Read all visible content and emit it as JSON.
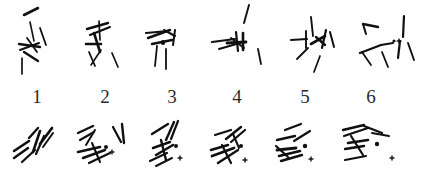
{
  "figure": {
    "type": "scatter",
    "title": "",
    "background_color": "#ffffff",
    "ink_color": "#101010",
    "label_color": "#2b2b2b",
    "width": 431,
    "height": 178,
    "rows": 2,
    "columns": 6
  },
  "labels": {
    "items": [
      {
        "text": "1",
        "x": 22,
        "y": 84
      },
      {
        "text": "2",
        "x": 90,
        "y": 84
      },
      {
        "text": "3",
        "x": 157,
        "y": 84
      },
      {
        "text": "4",
        "x": 222,
        "y": 84
      },
      {
        "text": "5",
        "x": 290,
        "y": 84
      },
      {
        "text": "6",
        "x": 356,
        "y": 84
      }
    ]
  },
  "chart_data": {
    "type": "scatter",
    "title": "",
    "xlabel": "",
    "ylabel": "",
    "legend": [],
    "grid": false,
    "panel_labels": [
      "1",
      "2",
      "3",
      "4",
      "5",
      "6"
    ],
    "marker_types": [
      "stroke-segment",
      "filled-dot",
      "plus-cross"
    ],
    "top_row": [
      {
        "label": "1",
        "strokes": [
          {
            "x1": 24,
            "y1": 15,
            "x2": 38,
            "y2": 8,
            "w": 2.6
          },
          {
            "x1": 30,
            "y1": 22,
            "x2": 34,
            "y2": 41,
            "w": 1.6
          },
          {
            "x1": 19,
            "y1": 44,
            "x2": 40,
            "y2": 47,
            "w": 2.4
          },
          {
            "x1": 20,
            "y1": 50,
            "x2": 39,
            "y2": 43,
            "w": 2.0
          },
          {
            "x1": 27,
            "y1": 38,
            "x2": 37,
            "y2": 52,
            "w": 1.8
          },
          {
            "x1": 24,
            "y1": 52,
            "x2": 38,
            "y2": 61,
            "w": 2.4
          },
          {
            "x1": 40,
            "y1": 28,
            "x2": 46,
            "y2": 45,
            "w": 1.8
          },
          {
            "x1": 22,
            "y1": 58,
            "x2": 22,
            "y2": 74,
            "w": 1.7
          }
        ],
        "dot": null,
        "plus": null
      },
      {
        "label": "2",
        "strokes": [
          {
            "x1": 87,
            "y1": 29,
            "x2": 108,
            "y2": 23,
            "w": 2.4
          },
          {
            "x1": 90,
            "y1": 35,
            "x2": 110,
            "y2": 27,
            "w": 2.1
          },
          {
            "x1": 99,
            "y1": 21,
            "x2": 100,
            "y2": 40,
            "w": 1.7
          },
          {
            "x1": 86,
            "y1": 44,
            "x2": 101,
            "y2": 44,
            "w": 2.5
          },
          {
            "x1": 94,
            "y1": 33,
            "x2": 100,
            "y2": 52,
            "w": 2.6
          },
          {
            "x1": 89,
            "y1": 52,
            "x2": 95,
            "y2": 66,
            "w": 1.8
          },
          {
            "x1": 101,
            "y1": 50,
            "x2": 91,
            "y2": 65,
            "w": 1.6
          },
          {
            "x1": 112,
            "y1": 53,
            "x2": 118,
            "y2": 67,
            "w": 1.7
          }
        ],
        "dot": null,
        "plus": null
      },
      {
        "label": "3",
        "strokes": [
          {
            "x1": 146,
            "y1": 33,
            "x2": 168,
            "y2": 31,
            "w": 2.2
          },
          {
            "x1": 148,
            "y1": 38,
            "x2": 170,
            "y2": 30,
            "w": 2.4
          },
          {
            "x1": 164,
            "y1": 30,
            "x2": 175,
            "y2": 36,
            "w": 2.0
          },
          {
            "x1": 175,
            "y1": 30,
            "x2": 173,
            "y2": 45,
            "w": 2.0
          },
          {
            "x1": 152,
            "y1": 44,
            "x2": 172,
            "y2": 40,
            "w": 2.4
          },
          {
            "x1": 163,
            "y1": 42,
            "x2": 163,
            "y2": 43,
            "w": 4.2
          },
          {
            "x1": 157,
            "y1": 46,
            "x2": 155,
            "y2": 66,
            "w": 1.8
          },
          {
            "x1": 166,
            "y1": 49,
            "x2": 166,
            "y2": 69,
            "w": 1.8
          }
        ],
        "dot": null,
        "plus": null
      },
      {
        "label": "4",
        "strokes": [
          {
            "x1": 249,
            "y1": 5,
            "x2": 244,
            "y2": 23,
            "w": 1.9
          },
          {
            "x1": 212,
            "y1": 42,
            "x2": 235,
            "y2": 39,
            "w": 2.2
          },
          {
            "x1": 219,
            "y1": 49,
            "x2": 240,
            "y2": 43,
            "w": 2.0
          },
          {
            "x1": 227,
            "y1": 43,
            "x2": 246,
            "y2": 42,
            "w": 2.8
          },
          {
            "x1": 236,
            "y1": 32,
            "x2": 238,
            "y2": 51,
            "w": 2.2
          },
          {
            "x1": 243,
            "y1": 33,
            "x2": 243,
            "y2": 50,
            "w": 2.6
          },
          {
            "x1": 231,
            "y1": 38,
            "x2": 244,
            "y2": 48,
            "w": 2.0
          },
          {
            "x1": 258,
            "y1": 49,
            "x2": 261,
            "y2": 64,
            "w": 1.8
          }
        ],
        "dot": null,
        "plus": null
      },
      {
        "label": "5",
        "strokes": [
          {
            "x1": 291,
            "y1": 40,
            "x2": 307,
            "y2": 39,
            "w": 2.0
          },
          {
            "x1": 306,
            "y1": 31,
            "x2": 306,
            "y2": 48,
            "w": 1.9
          },
          {
            "x1": 311,
            "y1": 17,
            "x2": 313,
            "y2": 36,
            "w": 1.9
          },
          {
            "x1": 311,
            "y1": 44,
            "x2": 325,
            "y2": 36,
            "w": 2.6
          },
          {
            "x1": 316,
            "y1": 37,
            "x2": 325,
            "y2": 45,
            "w": 2.4
          },
          {
            "x1": 326,
            "y1": 30,
            "x2": 322,
            "y2": 48,
            "w": 2.2
          },
          {
            "x1": 330,
            "y1": 32,
            "x2": 334,
            "y2": 47,
            "w": 2.0
          },
          {
            "x1": 297,
            "y1": 59,
            "x2": 308,
            "y2": 48,
            "w": 1.8
          },
          {
            "x1": 314,
            "y1": 72,
            "x2": 320,
            "y2": 56,
            "w": 1.7
          }
        ],
        "dot": null,
        "plus": null
      },
      {
        "label": "6",
        "strokes": [
          {
            "x1": 363,
            "y1": 24,
            "x2": 378,
            "y2": 27,
            "w": 2.4
          },
          {
            "x1": 363,
            "y1": 24,
            "x2": 366,
            "y2": 34,
            "w": 2.0
          },
          {
            "x1": 404,
            "y1": 16,
            "x2": 403,
            "y2": 37,
            "w": 2.2
          },
          {
            "x1": 360,
            "y1": 53,
            "x2": 381,
            "y2": 45,
            "w": 2.4
          },
          {
            "x1": 381,
            "y1": 45,
            "x2": 393,
            "y2": 43,
            "w": 2.2
          },
          {
            "x1": 400,
            "y1": 41,
            "x2": 398,
            "y2": 58,
            "w": 2.2
          },
          {
            "x1": 408,
            "y1": 43,
            "x2": 414,
            "y2": 60,
            "w": 1.9
          },
          {
            "x1": 371,
            "y1": 65,
            "x2": 362,
            "y2": 52,
            "w": 1.8
          },
          {
            "x1": 388,
            "y1": 67,
            "x2": 382,
            "y2": 52,
            "w": 1.8
          }
        ],
        "dot": {
          "x": 394,
          "y": 41,
          "r": 1.6
        },
        "plus": {
          "x": 399,
          "y": 41,
          "size": 5
        }
      }
    ],
    "bottom_row": [
      {
        "strokes": [
          {
            "x1": 14,
            "y1": 151,
            "x2": 29,
            "y2": 141,
            "w": 2.6
          },
          {
            "x1": 14,
            "y1": 158,
            "x2": 28,
            "y2": 148,
            "w": 2.4
          },
          {
            "x1": 22,
            "y1": 162,
            "x2": 35,
            "y2": 150,
            "w": 2.2
          },
          {
            "x1": 29,
            "y1": 138,
            "x2": 38,
            "y2": 128,
            "w": 2.4
          },
          {
            "x1": 33,
            "y1": 152,
            "x2": 40,
            "y2": 131,
            "w": 2.6
          },
          {
            "x1": 36,
            "y1": 154,
            "x2": 44,
            "y2": 136,
            "w": 2.2
          },
          {
            "x1": 40,
            "y1": 144,
            "x2": 52,
            "y2": 128,
            "w": 2.8
          },
          {
            "x1": 43,
            "y1": 147,
            "x2": 53,
            "y2": 133,
            "w": 2.0
          }
        ],
        "dot": null,
        "plus": null
      },
      {
        "strokes": [
          {
            "x1": 78,
            "y1": 133,
            "x2": 93,
            "y2": 126,
            "w": 2.4
          },
          {
            "x1": 80,
            "y1": 140,
            "x2": 94,
            "y2": 132,
            "w": 2.2
          },
          {
            "x1": 86,
            "y1": 145,
            "x2": 95,
            "y2": 130,
            "w": 2.0
          },
          {
            "x1": 113,
            "y1": 127,
            "x2": 121,
            "y2": 142,
            "w": 2.2
          },
          {
            "x1": 122,
            "y1": 124,
            "x2": 124,
            "y2": 143,
            "w": 2.4
          },
          {
            "x1": 78,
            "y1": 152,
            "x2": 100,
            "y2": 147,
            "w": 2.6
          },
          {
            "x1": 83,
            "y1": 158,
            "x2": 105,
            "y2": 150,
            "w": 2.4
          },
          {
            "x1": 89,
            "y1": 163,
            "x2": 110,
            "y2": 153,
            "w": 2.2
          },
          {
            "x1": 92,
            "y1": 143,
            "x2": 100,
            "y2": 162,
            "w": 2.0
          }
        ],
        "dot": {
          "x": 106,
          "y": 147,
          "r": 2.0
        },
        "plus": {
          "x": 112,
          "y": 152,
          "size": 5
        }
      },
      {
        "strokes": [
          {
            "x1": 152,
            "y1": 134,
            "x2": 168,
            "y2": 124,
            "w": 2.4
          },
          {
            "x1": 166,
            "y1": 140,
            "x2": 174,
            "y2": 122,
            "w": 2.4
          },
          {
            "x1": 171,
            "y1": 139,
            "x2": 178,
            "y2": 121,
            "w": 2.2
          },
          {
            "x1": 153,
            "y1": 148,
            "x2": 170,
            "y2": 142,
            "w": 2.4
          },
          {
            "x1": 156,
            "y1": 155,
            "x2": 173,
            "y2": 145,
            "w": 2.6
          },
          {
            "x1": 161,
            "y1": 140,
            "x2": 166,
            "y2": 160,
            "w": 2.4
          },
          {
            "x1": 150,
            "y1": 161,
            "x2": 167,
            "y2": 153,
            "w": 2.2
          },
          {
            "x1": 156,
            "y1": 166,
            "x2": 172,
            "y2": 158,
            "w": 2.0
          }
        ],
        "dot": {
          "x": 176,
          "y": 146,
          "r": 2.0
        },
        "plus": {
          "x": 180,
          "y": 158,
          "size": 5
        }
      },
      {
        "strokes": [
          {
            "x1": 215,
            "y1": 135,
            "x2": 231,
            "y2": 130,
            "w": 2.2
          },
          {
            "x1": 226,
            "y1": 139,
            "x2": 241,
            "y2": 127,
            "w": 2.4
          },
          {
            "x1": 231,
            "y1": 142,
            "x2": 245,
            "y2": 130,
            "w": 2.2
          },
          {
            "x1": 211,
            "y1": 150,
            "x2": 228,
            "y2": 145,
            "w": 2.6
          },
          {
            "x1": 212,
            "y1": 156,
            "x2": 234,
            "y2": 148,
            "w": 2.8
          },
          {
            "x1": 218,
            "y1": 163,
            "x2": 238,
            "y2": 150,
            "w": 2.4
          },
          {
            "x1": 222,
            "y1": 145,
            "x2": 231,
            "y2": 163,
            "w": 2.2
          },
          {
            "x1": 233,
            "y1": 134,
            "x2": 239,
            "y2": 148,
            "w": 2.0
          }
        ],
        "dot": {
          "x": 241,
          "y": 146,
          "r": 2.0
        },
        "plus": {
          "x": 245,
          "y": 160,
          "size": 5
        }
      },
      {
        "strokes": [
          {
            "x1": 285,
            "y1": 130,
            "x2": 301,
            "y2": 124,
            "w": 2.2
          },
          {
            "x1": 277,
            "y1": 140,
            "x2": 295,
            "y2": 136,
            "w": 2.4
          },
          {
            "x1": 294,
            "y1": 141,
            "x2": 310,
            "y2": 131,
            "w": 2.2
          },
          {
            "x1": 277,
            "y1": 150,
            "x2": 296,
            "y2": 148,
            "w": 2.8
          },
          {
            "x1": 279,
            "y1": 156,
            "x2": 300,
            "y2": 151,
            "w": 2.6
          },
          {
            "x1": 281,
            "y1": 161,
            "x2": 302,
            "y2": 155,
            "w": 2.4
          },
          {
            "x1": 276,
            "y1": 146,
            "x2": 288,
            "y2": 157,
            "w": 2.2
          }
        ],
        "dot": {
          "x": 305,
          "y": 146,
          "r": 2.2
        },
        "plus": {
          "x": 311,
          "y": 159,
          "size": 5
        }
      },
      {
        "strokes": [
          {
            "x1": 343,
            "y1": 130,
            "x2": 364,
            "y2": 125,
            "w": 2.4
          },
          {
            "x1": 344,
            "y1": 136,
            "x2": 368,
            "y2": 128,
            "w": 2.2
          },
          {
            "x1": 364,
            "y1": 126,
            "x2": 382,
            "y2": 133,
            "w": 2.4
          },
          {
            "x1": 372,
            "y1": 133,
            "x2": 389,
            "y2": 136,
            "w": 2.0
          },
          {
            "x1": 348,
            "y1": 143,
            "x2": 368,
            "y2": 140,
            "w": 2.6
          },
          {
            "x1": 345,
            "y1": 149,
            "x2": 364,
            "y2": 146,
            "w": 2.4
          },
          {
            "x1": 351,
            "y1": 136,
            "x2": 363,
            "y2": 155,
            "w": 2.2
          },
          {
            "x1": 345,
            "y1": 160,
            "x2": 366,
            "y2": 156,
            "w": 2.2
          }
        ],
        "dot": {
          "x": 377,
          "y": 144,
          "r": 2.2
        },
        "plus": {
          "x": 392,
          "y": 158,
          "size": 5
        }
      }
    ]
  }
}
